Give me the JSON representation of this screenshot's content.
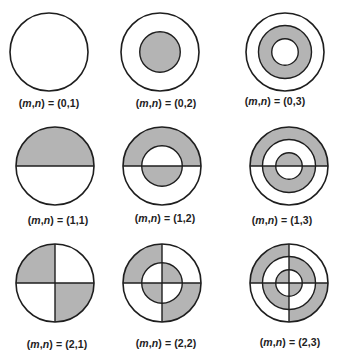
{
  "colors": {
    "fill": "#b4b4b4",
    "stroke": "#1e1e1e",
    "background": "#ffffff"
  },
  "label_prefix": "(m,n) = ",
  "modes": [
    {
      "m": 0,
      "n": 1,
      "label": "(0,1)",
      "cx": 49,
      "cy": 52,
      "lx": 49,
      "ly": 97
    },
    {
      "m": 0,
      "n": 2,
      "label": "(0,2)",
      "cx": 160,
      "cy": 52,
      "lx": 166,
      "ly": 97
    },
    {
      "m": 0,
      "n": 3,
      "label": "(0,3)",
      "cx": 285,
      "cy": 52,
      "lx": 275,
      "ly": 95
    },
    {
      "m": 1,
      "n": 1,
      "label": "(1,1)",
      "cx": 55,
      "cy": 166,
      "lx": 58,
      "ly": 214
    },
    {
      "m": 1,
      "n": 2,
      "label": "(1,2)",
      "cx": 162,
      "cy": 166,
      "lx": 165,
      "ly": 212
    },
    {
      "m": 1,
      "n": 3,
      "label": "(1,3)",
      "cx": 289,
      "cy": 166,
      "lx": 282,
      "ly": 214
    },
    {
      "m": 2,
      "n": 1,
      "label": "(2,1)",
      "cx": 55,
      "cy": 283,
      "lx": 57,
      "ly": 338
    },
    {
      "m": 2,
      "n": 2,
      "label": "(2,2)",
      "cx": 162,
      "cy": 283,
      "lx": 166,
      "ly": 337
    },
    {
      "m": 2,
      "n": 3,
      "label": "(2,3)",
      "cx": 289,
      "cy": 283,
      "lx": 290,
      "ly": 336
    }
  ]
}
